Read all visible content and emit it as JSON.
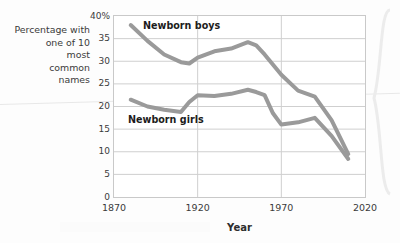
{
  "figure": {
    "name": "newborn-common-names-line-chart",
    "y_axis_caption": "Percentage with one of 10 most common names",
    "y_axis_caption_lines": [
      "Percentage with",
      "one of 10",
      "most",
      "common",
      "names"
    ]
  },
  "chart_data": {
    "type": "line",
    "title": "",
    "subtitle": "",
    "xlabel": "Year",
    "ylabel": "Percentage with one of 10 most common names",
    "xlim": [
      1870,
      2020
    ],
    "ylim": [
      0,
      40
    ],
    "xticks": [
      "1870",
      "1920",
      "1970",
      "2020"
    ],
    "xtick_values": [
      1870,
      1920,
      1970,
      2020
    ],
    "yticks": [
      "0",
      "5",
      "10",
      "15",
      "20",
      "25",
      "30",
      "35",
      "40%"
    ],
    "ytick_values": [
      0,
      5,
      10,
      15,
      20,
      25,
      30,
      35,
      40
    ],
    "grid": true,
    "grid_axes": "both",
    "legend": "inline-annotations",
    "line_color": "#9a9a9a",
    "line_width": 4,
    "series": [
      {
        "name": "Newborn boys",
        "annotation": "Newborn boys",
        "x": [
          1880,
          1890,
          1900,
          1910,
          1915,
          1920,
          1930,
          1940,
          1950,
          1955,
          1960,
          1970,
          1980,
          1990,
          2000,
          2010
        ],
        "values": [
          38.0,
          34.5,
          31.5,
          29.8,
          29.5,
          30.8,
          32.2,
          32.8,
          34.2,
          33.5,
          31.5,
          27.0,
          23.5,
          22.2,
          17.0,
          9.5
        ]
      },
      {
        "name": "Newborn girls",
        "annotation": "Newborn girls",
        "x": [
          1880,
          1890,
          1900,
          1910,
          1915,
          1920,
          1930,
          1940,
          1950,
          1955,
          1960,
          1965,
          1970,
          1980,
          1990,
          2000,
          2010
        ],
        "values": [
          21.5,
          20.0,
          19.3,
          18.8,
          21.0,
          22.5,
          22.3,
          22.8,
          23.7,
          23.2,
          22.5,
          18.5,
          16.0,
          16.5,
          17.5,
          13.5,
          8.4
        ]
      }
    ]
  },
  "axis_title": {
    "x": "Year"
  }
}
